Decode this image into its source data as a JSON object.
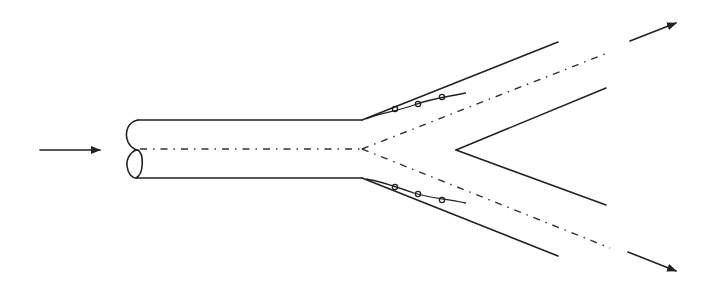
{
  "diagram": {
    "type": "pipe-bifurcation",
    "colors": {
      "stroke": "#222222",
      "background": "#ffffff"
    },
    "elements": {
      "inlet_arrow": {
        "from": [
          40,
          150
        ],
        "to": [
          100,
          150
        ]
      },
      "main_pipe": {
        "x_start": 128,
        "x_end": 362,
        "top_y": 120,
        "bottom_y": 178,
        "break_symbol": "S-curve cut"
      },
      "upper_branch": {
        "outer_end": [
          558,
          42
        ],
        "inner_start": [
          456,
          150
        ],
        "inner_end": [
          606,
          88
        ]
      },
      "lower_branch": {
        "outer_end": [
          558,
          256
        ],
        "inner_end": [
          606,
          205
        ]
      },
      "upper_outlet_arrow": {
        "from": [
          630,
          40
        ],
        "to": [
          676,
          22
        ]
      },
      "lower_outlet_arrow": {
        "from": [
          630,
          252
        ],
        "to": [
          676,
          272
        ]
      },
      "weld_beads_upper": 3,
      "weld_beads_lower": 3
    },
    "labels": []
  }
}
